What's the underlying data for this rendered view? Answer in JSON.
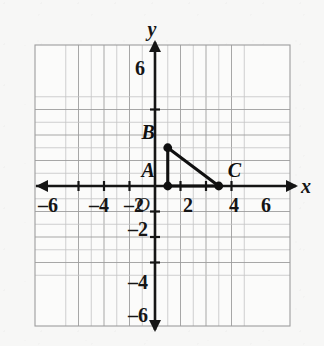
{
  "figure": {
    "background_color": "#f7f7f6",
    "ink_color": "#151515",
    "grid_color": "#9a9a9a"
  },
  "chart_data": {
    "type": "scatter",
    "title": "",
    "xlabel": "x",
    "ylabel": "y",
    "xlim": [
      -7,
      7
    ],
    "ylim": [
      -7,
      7
    ],
    "grid": true,
    "legend": false,
    "origin_label": "O",
    "x_ticks": [
      -6,
      -4,
      -2,
      2,
      4,
      6
    ],
    "y_ticks": [
      6,
      -2,
      -4,
      -6
    ],
    "x_tick_labels": [
      "–6",
      "–4",
      "–2",
      "2",
      "4",
      "6"
    ],
    "y_tick_labels": [
      "6",
      "–2",
      "–4",
      "–6"
    ],
    "points": [
      {
        "name": "A",
        "x": 1,
        "y": 0,
        "label": "A",
        "label_position": "upper-left"
      },
      {
        "name": "B",
        "x": 1,
        "y": 3,
        "label": "B",
        "label_position": "upper-left"
      },
      {
        "name": "C",
        "x": 5,
        "y": 0,
        "label": "C",
        "label_position": "upper-right"
      }
    ],
    "segments": [
      {
        "from": "A",
        "to": "B"
      },
      {
        "from": "B",
        "to": "C"
      },
      {
        "from": "A",
        "to": "C"
      }
    ],
    "annotations": []
  }
}
